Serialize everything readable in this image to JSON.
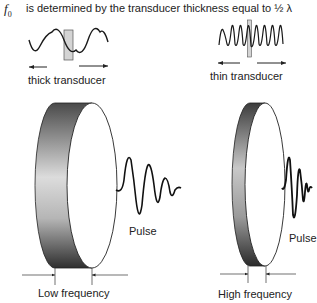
{
  "title": {
    "symbol": "f",
    "subscript": "0",
    "text": "is determined by the transducer thickness equal to ½ λ"
  },
  "top_illustrations": [
    {
      "label": "thick transducer",
      "wave": "low-frequency-sine",
      "cycles": 3
    },
    {
      "label": "thin transducer",
      "wave": "high-frequency-sine",
      "cycles": 8
    }
  ],
  "transducers": [
    {
      "name": "thick",
      "pulse_label": "Pulse",
      "frequency_label": "Low frequency"
    },
    {
      "name": "thin",
      "pulse_label": "Pulse",
      "frequency_label": "High frequency"
    }
  ],
  "colors": {
    "band_dark": "#3a3a3a",
    "band_light": "#d8d8d8",
    "face": "#ffffff",
    "stroke": "#222222",
    "marker_fill": "#d4d4d4"
  }
}
